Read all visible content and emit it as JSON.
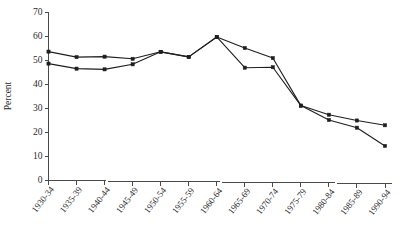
{
  "chart_data": {
    "type": "line",
    "title": "",
    "subtitle": "",
    "xlabel": "",
    "ylabel": "Percent",
    "ylim": [
      0,
      70
    ],
    "yticks": [
      0,
      10,
      20,
      30,
      40,
      50,
      60,
      70
    ],
    "ytick_labels": [
      "0",
      "10",
      "20",
      "30",
      "40",
      "50",
      "60",
      "70"
    ],
    "grid": false,
    "legend": "none",
    "categories": [
      "1930-34",
      "1935-39",
      "1940-44",
      "1945-49",
      "1950-54",
      "1955-59",
      "1960-64",
      "1965-69",
      "1970-74",
      "1975-79",
      "1980-84",
      "1985-89",
      "1990-94"
    ],
    "series": [
      {
        "name": "series-upper",
        "values": [
          53.5,
          51.2,
          51.4,
          50.5,
          53.4,
          51.3,
          59.6,
          55.0,
          50.8,
          31.0,
          27.2,
          24.8,
          22.8
        ]
      },
      {
        "name": "series-lower",
        "values": [
          48.5,
          46.4,
          46.1,
          48.2,
          53.4,
          51.3,
          59.6,
          46.8,
          47.0,
          31.0,
          25.0,
          21.8,
          14.2
        ]
      }
    ]
  },
  "axis": {
    "y_title": "Percent"
  }
}
